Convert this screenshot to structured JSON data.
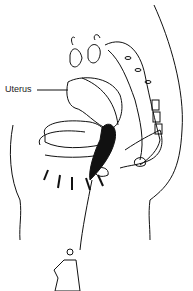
{
  "figure": {
    "labels": [
      {
        "text": "Uterus",
        "x": 5,
        "y": 84
      }
    ],
    "colors": {
      "ink": "#111111",
      "background": "#ffffff"
    }
  }
}
